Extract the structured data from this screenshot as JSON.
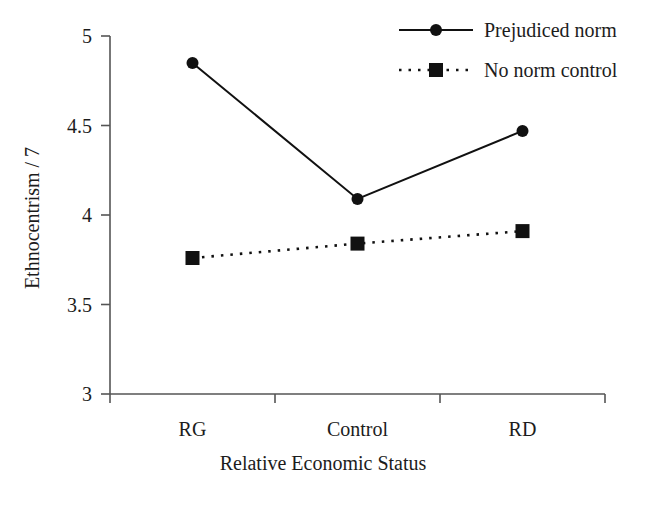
{
  "chart_data": {
    "type": "line",
    "title": "",
    "xlabel": "Relative Economic Status",
    "ylabel": "Ethnocentrism / 7",
    "categories": [
      "RG",
      "Control",
      "RD"
    ],
    "ylim": [
      3,
      5
    ],
    "yticks": [
      "3",
      "3.5",
      "4",
      "4.5",
      "5"
    ],
    "ytick_values": [
      3,
      3.5,
      4,
      4.5,
      5
    ],
    "grid": false,
    "legend_position": "top-right",
    "series": [
      {
        "name": "Prejudiced norm",
        "values": [
          4.85,
          4.09,
          4.47
        ],
        "marker": "circle",
        "linestyle": "solid",
        "color": "#000000"
      },
      {
        "name": "No norm control",
        "values": [
          3.76,
          3.84,
          3.91
        ],
        "marker": "square",
        "linestyle": "dotted",
        "color": "#000000"
      }
    ]
  },
  "axes": {
    "y_title": "Ethnocentrism / 7",
    "x_title": "Relative Economic Status",
    "y_tick_labels": [
      "5",
      "4.5",
      "4",
      "3.5",
      "3"
    ],
    "x_tick_labels": [
      "RG",
      "Control",
      "RD"
    ]
  },
  "legend": {
    "entries": [
      {
        "label": "Prejudiced norm",
        "marker": "circle-marker",
        "style": "solid"
      },
      {
        "label": "No norm control",
        "marker": "square-marker",
        "style": "dotted"
      }
    ]
  },
  "colors": {
    "axis": "#555555",
    "series": "#000000",
    "text": "#1c1c1c",
    "background": "#ffffff"
  }
}
